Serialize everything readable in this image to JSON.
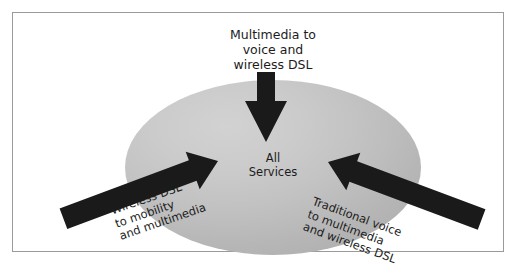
{
  "diagram": {
    "title_hidden": "",
    "frame": {
      "border_color": "#9a9a9a",
      "background_color": "#ffffff"
    },
    "center_shape": {
      "type": "ellipse",
      "fill_light": "#d2d2d2",
      "fill_dark": "#b2b2b2",
      "label": "All\nServices"
    },
    "arrow_color": "#1a1a1a",
    "arrows": [
      {
        "id": "top-arrow",
        "direction": "down",
        "label": "Multimedia to\nvoice and\nwireless DSL",
        "label_align": "center",
        "rotation_deg": 0
      },
      {
        "id": "left-arrow",
        "direction": "up-right",
        "label": "Wireless DSL\nto mobility\nand multimedia",
        "label_align": "left",
        "rotation_deg": -19
      },
      {
        "id": "right-arrow",
        "direction": "up-left",
        "label": "Traditional voice\nto multimedia\nand wireless DSL",
        "label_align": "left",
        "rotation_deg": 20
      }
    ]
  }
}
